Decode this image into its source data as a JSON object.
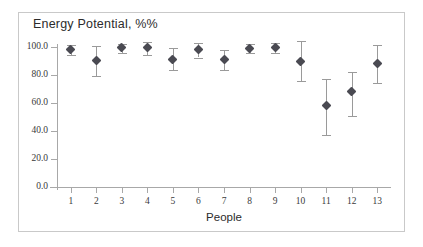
{
  "chart_data": {
    "type": "scatter",
    "title": "Energy Potential, %%",
    "xlabel": "People",
    "ylabel": "",
    "grid": false,
    "legend": false,
    "xlim": [
      0.5,
      13.5
    ],
    "ylim": [
      0.0,
      106.0
    ],
    "yticks": [
      "0.0",
      "20.0",
      "40.0",
      "60.0",
      "80.0",
      "100.0"
    ],
    "ytick_values": [
      0.0,
      20.0,
      40.0,
      60.0,
      80.0,
      100.0
    ],
    "categories": [
      "1",
      "2",
      "3",
      "4",
      "5",
      "6",
      "7",
      "8",
      "9",
      "10",
      "11",
      "12",
      "13"
    ],
    "values": [
      98.0,
      90.5,
      99.5,
      99.5,
      91.0,
      98.0,
      91.0,
      99.0,
      100.0,
      90.0,
      58.5,
      68.5,
      88.0
    ],
    "error_low": [
      94.5,
      79.5,
      95.5,
      94.5,
      83.5,
      92.5,
      83.5,
      95.5,
      96.0,
      75.5,
      37.5,
      51.0,
      74.5
    ],
    "error_high": [
      101.5,
      101.0,
      102.5,
      103.5,
      99.0,
      103.0,
      98.0,
      102.0,
      103.0,
      104.0,
      77.5,
      82.5,
      101.5
    ],
    "marker_color": "#4a4a52",
    "error_color": "#9a9a9a",
    "axis_color": "#a8a8a8",
    "frame_color": "#c9c9c9",
    "background_color": "#ffffff"
  }
}
